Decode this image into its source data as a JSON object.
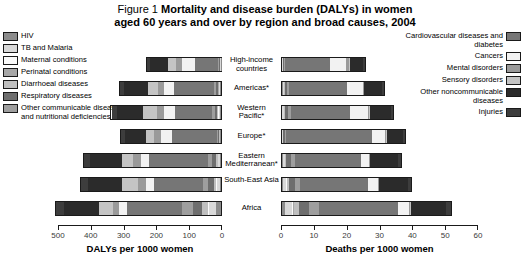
{
  "title": {
    "figure_label": "Figure 1",
    "line1": "Mortality and disease burden (DALYs) in women",
    "line2": "aged 60 years and over by region and broad causes, 2004"
  },
  "legend_left": {
    "items": [
      {
        "label": "HIV",
        "color": "#8c8c8c"
      },
      {
        "label": "TB and Malaria",
        "color": "#d9d9d9"
      },
      {
        "label": "Maternal conditions",
        "color": "#fafafa"
      },
      {
        "label": "Perinatal conditions",
        "color": "#a8a8a8"
      },
      {
        "label": "Diarrhoeal diseases",
        "color": "#bfbfbf"
      },
      {
        "label": "Respiratory diseases",
        "color": "#6e6e6e"
      },
      {
        "label": "Other communicable diseases and nutritional deficiencies",
        "color": "#9e9e9e"
      }
    ]
  },
  "legend_right": {
    "items": [
      {
        "label": "Cardiovascular diseases and diabetes",
        "color": "#767676"
      },
      {
        "label": "Cancers",
        "color": "#f2f2f2"
      },
      {
        "label": "Mental disorders",
        "color": "#9a9a9a"
      },
      {
        "label": "Sensory disorders",
        "color": "#c4c4c4"
      },
      {
        "label": "Other noncommunicable diseases",
        "color": "#2b2b2b"
      },
      {
        "label": "Injuries",
        "color": "#3d3d3d"
      }
    ]
  },
  "regions": [
    "High-income countries",
    "Americas*",
    "Western Pacific*",
    "Europe*",
    "Eastern Mediterranean*",
    "South-East Asia",
    "Africa"
  ],
  "axes": {
    "left": {
      "title": "DALYs per 1000 women",
      "ticks": [
        500,
        400,
        300,
        200,
        100,
        0
      ],
      "min": 0,
      "max": 500,
      "reversed": true
    },
    "right": {
      "title": "Deaths per 1000 women",
      "ticks": [
        0,
        10,
        20,
        30,
        40,
        50,
        60
      ],
      "min": 0,
      "max": 60,
      "reversed": false
    }
  },
  "chart_data": [
    {
      "type": "bar",
      "id": "dalys",
      "orientation": "horizontal",
      "direction": "right-to-left",
      "title": "DALYs per 1000 women",
      "xlabel": "DALYs per 1000 women",
      "ylabel": "",
      "xlim": [
        0,
        500
      ],
      "grid": false,
      "legend_position": "left",
      "categories": [
        "High-income countries",
        "Americas*",
        "Western Pacific*",
        "Europe*",
        "Eastern Mediterranean*",
        "South-East Asia",
        "Africa"
      ],
      "series": [
        {
          "name": "HIV",
          "color": "#8c8c8c",
          "values": [
            1,
            3,
            2,
            2,
            3,
            4,
            15
          ]
        },
        {
          "name": "TB and Malaria",
          "color": "#d9d9d9",
          "values": [
            1,
            3,
            5,
            2,
            5,
            10,
            22
          ]
        },
        {
          "name": "Maternal conditions",
          "color": "#fafafa",
          "values": [
            0,
            1,
            1,
            0,
            1,
            1,
            2
          ]
        },
        {
          "name": "Perinatal conditions",
          "color": "#a8a8a8",
          "values": [
            0,
            1,
            1,
            0,
            1,
            1,
            2
          ]
        },
        {
          "name": "Diarrhoeal diseases",
          "color": "#bfbfbf",
          "values": [
            1,
            2,
            3,
            1,
            5,
            7,
            17
          ]
        },
        {
          "name": "Respiratory diseases",
          "color": "#6e6e6e",
          "values": [
            3,
            6,
            8,
            4,
            12,
            16,
            30
          ]
        },
        {
          "name": "Other communicable diseases and nutritional deficiencies",
          "color": "#9e9e9e",
          "values": [
            3,
            6,
            8,
            5,
            12,
            16,
            32
          ]
        },
        {
          "name": "Cardiovascular diseases and diabetes",
          "color": "#767676",
          "values": [
            74,
            125,
            114,
            140,
            185,
            152,
            170
          ]
        },
        {
          "name": "Cancers",
          "color": "#f2f2f2",
          "values": [
            39,
            31,
            35,
            34,
            25,
            25,
            24
          ]
        },
        {
          "name": "Mental disorders",
          "color": "#9a9a9a",
          "values": [
            20,
            18,
            22,
            20,
            22,
            24,
            20
          ]
        },
        {
          "name": "Sensory disorders",
          "color": "#c4c4c4",
          "values": [
            25,
            30,
            42,
            24,
            36,
            52,
            42
          ]
        },
        {
          "name": "Other noncommunicable diseases",
          "color": "#2b2b2b",
          "values": [
            55,
            75,
            82,
            68,
            100,
            105,
            110
          ]
        },
        {
          "name": "Injuries",
          "color": "#3d3d3d",
          "values": [
            10,
            13,
            17,
            12,
            18,
            20,
            22
          ]
        }
      ],
      "totals": [
        232,
        314,
        340,
        312,
        425,
        433,
        508
      ]
    },
    {
      "type": "bar",
      "id": "deaths",
      "orientation": "horizontal",
      "direction": "left-to-right",
      "title": "Deaths per 1000 women",
      "xlabel": "Deaths per 1000 women",
      "ylabel": "",
      "xlim": [
        0,
        60
      ],
      "grid": false,
      "legend_position": "right",
      "categories": [
        "High-income countries",
        "Americas*",
        "Western Pacific*",
        "Europe*",
        "Eastern Mediterranean*",
        "South-East Asia",
        "Africa"
      ],
      "series": [
        {
          "name": "HIV",
          "color": "#8c8c8c",
          "values": [
            0.1,
            0.2,
            0.1,
            0.1,
            0.2,
            0.3,
            1.0
          ]
        },
        {
          "name": "TB and Malaria",
          "color": "#d9d9d9",
          "values": [
            0.1,
            0.3,
            0.5,
            0.2,
            0.6,
            1.0,
            2.2
          ]
        },
        {
          "name": "Maternal conditions",
          "color": "#fafafa",
          "values": [
            0.0,
            0.05,
            0.05,
            0.0,
            0.05,
            0.1,
            0.2
          ]
        },
        {
          "name": "Perinatal conditions",
          "color": "#a8a8a8",
          "values": [
            0.0,
            0.05,
            0.05,
            0.0,
            0.05,
            0.1,
            0.2
          ]
        },
        {
          "name": "Diarrhoeal diseases",
          "color": "#bfbfbf",
          "values": [
            0.1,
            0.2,
            0.3,
            0.1,
            0.5,
            0.7,
            1.6
          ]
        },
        {
          "name": "Respiratory diseases",
          "color": "#6e6e6e",
          "values": [
            0.4,
            0.7,
            0.9,
            0.5,
            1.4,
            1.8,
            3.1
          ]
        },
        {
          "name": "Other communicable diseases and nutritional deficiencies",
          "color": "#9e9e9e",
          "values": [
            0.3,
            0.6,
            0.8,
            0.5,
            1.2,
            1.6,
            3.0
          ]
        },
        {
          "name": "Cardiovascular diseases and diabetes",
          "color": "#767676",
          "values": [
            14.0,
            18.0,
            18.5,
            26.5,
            20.5,
            21.0,
            24.5
          ]
        },
        {
          "name": "Cancers",
          "color": "#f2f2f2",
          "values": [
            5.0,
            5.0,
            5.5,
            4.0,
            2.5,
            3.0,
            3.5
          ]
        },
        {
          "name": "Mental disorders",
          "color": "#9a9a9a",
          "values": [
            1.0,
            0.4,
            0.4,
            0.4,
            0.3,
            0.3,
            0.3
          ]
        },
        {
          "name": "Sensory disorders",
          "color": "#c4c4c4",
          "values": [
            0.1,
            0.1,
            0.1,
            0.1,
            0.1,
            0.1,
            0.1
          ]
        },
        {
          "name": "Other noncommunicable diseases",
          "color": "#2b2b2b",
          "values": [
            4.2,
            5.5,
            6.5,
            5.0,
            8.5,
            9.0,
            11.0
          ]
        },
        {
          "name": "Injuries",
          "color": "#3d3d3d",
          "values": [
            0.5,
            0.6,
            0.8,
            0.6,
            1.0,
            1.0,
            1.3
          ]
        }
      ],
      "totals": [
        25.8,
        31.7,
        34.5,
        38.0,
        36.9,
        40.0,
        52.0
      ]
    }
  ]
}
